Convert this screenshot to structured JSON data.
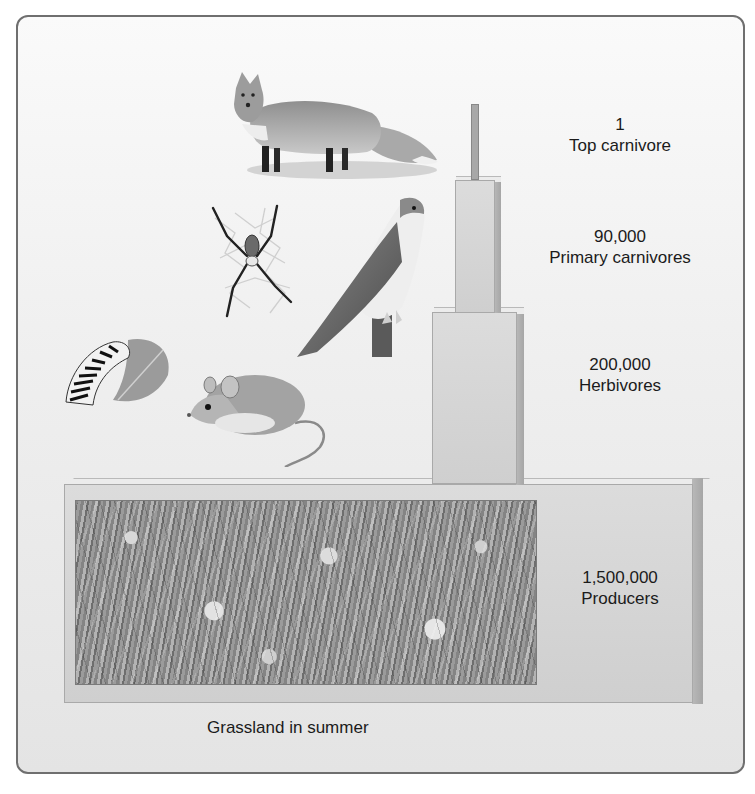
{
  "figure": {
    "caption": "Grassland in summer",
    "levels": [
      {
        "count": "1",
        "name": "Top carnivore",
        "organism": "fox"
      },
      {
        "count": "90,000",
        "name": "Primary carnivores",
        "organism": "spider, falcon"
      },
      {
        "count": "200,000",
        "name": "Herbivores",
        "organism": "caterpillar, mouse"
      },
      {
        "count": "1,500,000",
        "name": "Producers",
        "organism": "grassland plants"
      }
    ],
    "colors": {
      "frame_border": "#6f6f6f",
      "block_face": "#d6d6d6",
      "block_side": "#aaaaaa",
      "text": "#1b1b1b"
    }
  }
}
